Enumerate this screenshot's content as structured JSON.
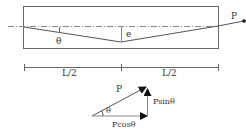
{
  "beam": {
    "force_label": "P",
    "angle_label": "θ",
    "eccentricity_label": "e"
  },
  "dimensions": {
    "left_label": "L/2",
    "right_label": "L/2"
  },
  "force_triangle": {
    "resultant_label": "P",
    "angle_label": "θ",
    "vertical_component_label": "Psinθ",
    "horizontal_component_label": "Pcosθ"
  },
  "colors": {
    "line": "#555555",
    "text": "#333333",
    "arrow": "#111111"
  }
}
